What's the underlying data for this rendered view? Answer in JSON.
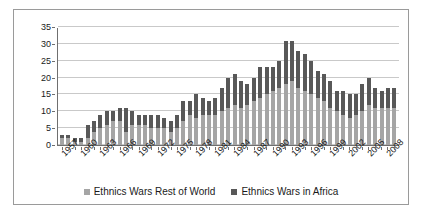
{
  "chart_data": {
    "type": "bar",
    "barmode": "stacked",
    "title": "",
    "xlabel": "",
    "ylabel": "",
    "ylim": [
      0,
      35
    ],
    "yticks": [
      0,
      5,
      10,
      15,
      20,
      25,
      30,
      35
    ],
    "grid": true,
    "legend_position": "bottom-center",
    "tick_label_interval": 3,
    "x": [
      1957,
      1958,
      1959,
      1960,
      1961,
      1962,
      1963,
      1964,
      1965,
      1966,
      1967,
      1968,
      1969,
      1970,
      1971,
      1972,
      1973,
      1974,
      1975,
      1976,
      1977,
      1978,
      1979,
      1980,
      1981,
      1982,
      1983,
      1984,
      1985,
      1986,
      1987,
      1988,
      1989,
      1990,
      1991,
      1992,
      1993,
      1994,
      1995,
      1996,
      1997,
      1998,
      1999,
      2000,
      2001,
      2002,
      2003,
      2004,
      2005,
      2006,
      2007,
      2008,
      2009
    ],
    "tick_labels": [
      "1957",
      "",
      "",
      "1960",
      "",
      "",
      "1963",
      "",
      "",
      "1966",
      "",
      "",
      "1969",
      "",
      "",
      "1972",
      "",
      "",
      "1975",
      "",
      "",
      "1978",
      "",
      "",
      "1981",
      "",
      "",
      "1984",
      "",
      "",
      "1987",
      "",
      "",
      "1990",
      "",
      "",
      "1993",
      "",
      "",
      "1996",
      "",
      "",
      "1999",
      "",
      "",
      "2002",
      "",
      "",
      "2005",
      "",
      "",
      "2008",
      ""
    ],
    "series": [
      {
        "name": "Ethnics Wars Rest of World",
        "color": "#a5a5a5",
        "values": [
          2,
          2,
          1,
          1,
          2,
          4,
          5,
          6,
          7,
          7,
          4,
          6,
          6,
          6,
          5,
          5,
          5,
          4,
          5,
          7,
          9,
          8,
          9,
          9,
          9,
          10,
          11,
          12,
          11,
          12,
          13,
          14,
          15,
          16,
          17,
          18,
          19,
          17,
          16,
          15,
          14,
          13,
          11,
          10,
          9,
          8,
          9,
          10,
          12,
          11,
          11,
          11,
          11
        ]
      },
      {
        "name": "Ethnics Wars in Africa",
        "color": "#585858",
        "values": [
          1,
          1,
          1,
          1,
          4,
          3,
          4,
          4,
          3,
          4,
          7,
          4,
          3,
          3,
          4,
          4,
          3,
          3,
          4,
          6,
          4,
          7,
          5,
          4,
          5,
          7,
          9,
          9,
          8,
          6,
          7,
          9,
          8,
          7,
          8,
          13,
          12,
          11,
          11,
          10,
          8,
          8,
          8,
          6,
          7,
          7,
          6,
          8,
          8,
          6,
          5,
          6,
          6
        ]
      }
    ],
    "totals": [
      3,
      3,
      2,
      2,
      6,
      7,
      9,
      10,
      10,
      11,
      11,
      10,
      9,
      9,
      9,
      9,
      8,
      7,
      9,
      13,
      13,
      15,
      14,
      13,
      14,
      17,
      20,
      21,
      19,
      18,
      20,
      23,
      23,
      25,
      30,
      31,
      28,
      27,
      25,
      22,
      21,
      21,
      19,
      16,
      15,
      15,
      15,
      18,
      20,
      17,
      16,
      17,
      17
    ]
  },
  "legend": {
    "items": [
      {
        "label": "Ethnics Wars Rest of World",
        "color": "#a5a5a5",
        "marker": "square-marker"
      },
      {
        "label": "Ethnics Wars in Africa",
        "color": "#585858",
        "marker": "square-marker"
      }
    ]
  }
}
